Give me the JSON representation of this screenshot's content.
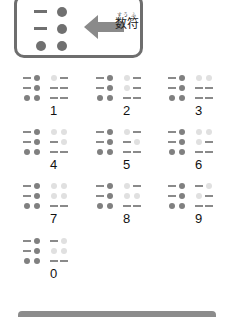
{
  "header": {
    "icon": "numeral-sign-braille-cell",
    "arrow_icon": "left-arrow-icon",
    "label": "数符",
    "ruby": "すう ふ",
    "numeral_sign_pattern": [
      [
        0,
        1
      ],
      [
        0,
        1
      ],
      [
        1,
        1
      ]
    ]
  },
  "legend_notes": {
    "dark_dot": "numeral sign raised dot",
    "light_dot": "raised dot",
    "dash": "unraised position"
  },
  "numbers": [
    {
      "label": "1",
      "pattern": [
        [
          1,
          0
        ],
        [
          0,
          0
        ],
        [
          0,
          0
        ]
      ]
    },
    {
      "label": "2",
      "pattern": [
        [
          1,
          0
        ],
        [
          1,
          0
        ],
        [
          0,
          0
        ]
      ]
    },
    {
      "label": "3",
      "pattern": [
        [
          1,
          1
        ],
        [
          0,
          0
        ],
        [
          0,
          0
        ]
      ]
    },
    {
      "label": "4",
      "pattern": [
        [
          1,
          1
        ],
        [
          0,
          1
        ],
        [
          0,
          0
        ]
      ]
    },
    {
      "label": "5",
      "pattern": [
        [
          1,
          0
        ],
        [
          0,
          1
        ],
        [
          0,
          0
        ]
      ]
    },
    {
      "label": "6",
      "pattern": [
        [
          1,
          1
        ],
        [
          1,
          0
        ],
        [
          0,
          0
        ]
      ]
    },
    {
      "label": "7",
      "pattern": [
        [
          1,
          1
        ],
        [
          1,
          1
        ],
        [
          0,
          0
        ]
      ]
    },
    {
      "label": "8",
      "pattern": [
        [
          1,
          0
        ],
        [
          1,
          1
        ],
        [
          0,
          0
        ]
      ]
    },
    {
      "label": "9",
      "pattern": [
        [
          0,
          1
        ],
        [
          1,
          0
        ],
        [
          0,
          0
        ]
      ]
    },
    {
      "label": "0",
      "pattern": [
        [
          0,
          1
        ],
        [
          1,
          1
        ],
        [
          0,
          0
        ]
      ]
    }
  ],
  "colors": {
    "dark": "#808080",
    "light": "#e0e0e0",
    "border": "#6e6e6e"
  }
}
